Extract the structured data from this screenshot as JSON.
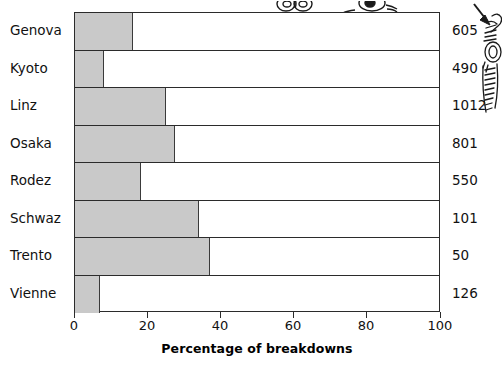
{
  "chart_data": {
    "type": "bar",
    "orientation": "horizontal",
    "title": "",
    "xlabel": "Percentage of breakdowns",
    "ylabel": "",
    "xlim": [
      0,
      100
    ],
    "xticks": [
      0,
      20,
      40,
      60,
      80,
      100
    ],
    "grid": false,
    "legend": null,
    "bar_color": "#c9c9c9",
    "bar_edge_color": "#3a3a3a",
    "axis_color": "#2b2b2b",
    "categories": [
      "Genova",
      "Kyoto",
      "Linz",
      "Osaka",
      "Rodez",
      "Schwaz",
      "Trento",
      "Vienne"
    ],
    "values": [
      16,
      8,
      25,
      27.5,
      18,
      34,
      37,
      7
    ],
    "right_column_values": [
      605,
      490,
      1012,
      801,
      550,
      101,
      50,
      126
    ],
    "rows": [
      {
        "category": "Genova",
        "value": 16,
        "right_value": 605
      },
      {
        "category": "Kyoto",
        "value": 8,
        "right_value": 490
      },
      {
        "category": "Linz",
        "value": 25,
        "right_value": 1012
      },
      {
        "category": "Osaka",
        "value": 27.5,
        "right_value": 801
      },
      {
        "category": "Rodez",
        "value": 18,
        "right_value": 550
      },
      {
        "category": "Schwaz",
        "value": 34,
        "right_value": 101
      },
      {
        "category": "Trento",
        "value": 37,
        "right_value": 50
      },
      {
        "category": "Vienne",
        "value": 7,
        "right_value": 126
      }
    ]
  },
  "annotations": {
    "side_illustration": "hand-holding-object-line-art",
    "arrow": "arrow-pointing-down-right",
    "top_illustration": "cropped-line-art"
  }
}
